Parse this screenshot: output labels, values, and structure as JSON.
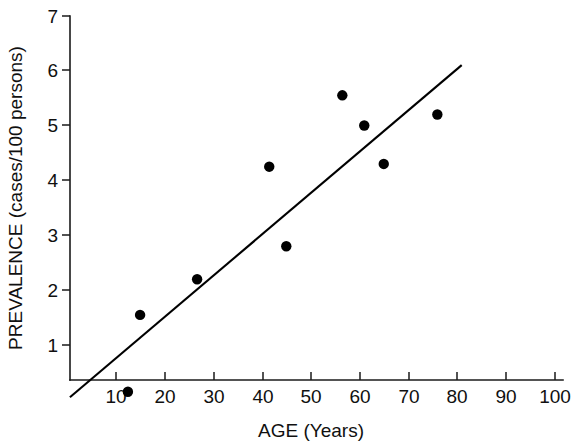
{
  "chart_data": {
    "type": "scatter",
    "title": "",
    "xlabel": "AGE  (Years)",
    "ylabel": "PREVALENCE (cases/100 persons)",
    "xlim": [
      0,
      100
    ],
    "ylim": [
      0,
      7
    ],
    "xticks": [
      10,
      20,
      30,
      40,
      50,
      60,
      70,
      80,
      90,
      100
    ],
    "yticks": [
      1,
      2,
      3,
      4,
      5,
      6,
      7
    ],
    "xtick_labels": [
      "10",
      "20",
      "30",
      "40",
      "50",
      "60",
      "70",
      "80",
      "90",
      "100"
    ],
    "ytick_labels": [
      "1",
      "2",
      "3",
      "4",
      "5",
      "6",
      "7"
    ],
    "grid": false,
    "legend": false,
    "series": [
      {
        "name": "observations",
        "marker": "filled-circle",
        "color": "#000000",
        "points": [
          {
            "x": 12.5,
            "y": 0.15
          },
          {
            "x": 15.0,
            "y": 1.55
          },
          {
            "x": 26.7,
            "y": 2.2
          },
          {
            "x": 41.5,
            "y": 4.25
          },
          {
            "x": 45.0,
            "y": 2.8
          },
          {
            "x": 56.5,
            "y": 5.55
          },
          {
            "x": 61.0,
            "y": 5.0
          },
          {
            "x": 65.0,
            "y": 4.3
          },
          {
            "x": 76.0,
            "y": 5.2
          }
        ]
      },
      {
        "name": "regression-line",
        "marker": "none",
        "color": "#000000",
        "line": {
          "x1": 0.6,
          "y1": 0.05,
          "x2": 81.0,
          "y2": 6.1
        }
      }
    ]
  },
  "axes": {
    "y_label": "PREVALENCE (cases/100 persons)",
    "x_label": "AGE  (Years)"
  }
}
